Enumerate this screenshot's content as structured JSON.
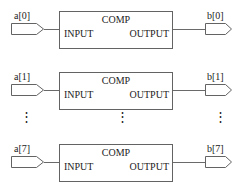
{
  "diagram": {
    "colors": {
      "line": "#636363",
      "wire": "#6a6a6a",
      "text": "#1c1c1c",
      "background": "#ffffff"
    },
    "block_labels": {
      "title": "COMP",
      "input": "INPUT",
      "output": "OUTPUT"
    },
    "ellipsis": {
      "glyph": "⋮"
    },
    "rows": [
      {
        "input_signal": "a[0]",
        "output_signal": "b[0]",
        "comp_title": "COMP",
        "input_port_label": "INPUT",
        "output_port_label": "OUTPUT"
      },
      {
        "input_signal": "a[1]",
        "output_signal": "b[1]",
        "comp_title": "COMP",
        "input_port_label": "INPUT",
        "output_port_label": "OUTPUT"
      },
      {
        "input_signal": "a[7]",
        "output_signal": "b[7]",
        "comp_title": "COMP",
        "input_port_label": "INPUT",
        "output_port_label": "OUTPUT"
      }
    ]
  }
}
